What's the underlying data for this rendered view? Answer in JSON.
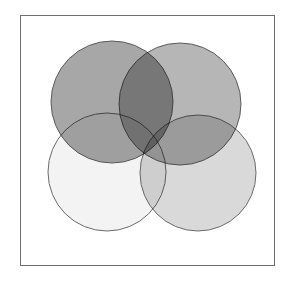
{
  "figure": {
    "kind": "venn-diagram",
    "width": 288,
    "height": 281,
    "background_color": "#ffffff",
    "title": ""
  },
  "frame": {
    "name": "plot-frame",
    "x": 20,
    "y": 15,
    "width": 255,
    "height": 251,
    "border_color": "#6e6e72",
    "border_width": 1,
    "fill_color": "#ffffff"
  },
  "chart_data": {
    "type": "venn",
    "title": "",
    "xlabel": "",
    "ylabel": "",
    "grid": false,
    "legend": "none",
    "axis_visible": false,
    "set_count": 4,
    "layout": "2x2 overlapping circles",
    "circles": [
      {
        "id": "circle-top-left",
        "label": "",
        "cx": 112,
        "cy": 102,
        "r": 61,
        "fill": "#8e8e8e",
        "opacity": 0.78,
        "stroke": "#5a5a5e",
        "stroke_width": 1,
        "tone": "dark-gray"
      },
      {
        "id": "circle-top-right",
        "label": "",
        "cx": 180,
        "cy": 104,
        "r": 61,
        "fill": "#9a9a9a",
        "opacity": 0.72,
        "stroke": "#5a5a5e",
        "stroke_width": 1,
        "tone": "medium-dark-gray"
      },
      {
        "id": "circle-bottom-left",
        "label": "",
        "cx": 107,
        "cy": 172,
        "r": 59,
        "fill": "#f1f1f1",
        "opacity": 0.88,
        "stroke": "#6a6a6e",
        "stroke_width": 1,
        "tone": "near-white"
      },
      {
        "id": "circle-bottom-right",
        "label": "",
        "cx": 198,
        "cy": 173,
        "r": 58,
        "fill": "#cfcfcf",
        "opacity": 0.8,
        "stroke": "#6a6a6e",
        "stroke_width": 1,
        "tone": "light-gray"
      }
    ],
    "intersections": [
      {
        "between": [
          "circle-top-left",
          "circle-top-right"
        ],
        "tone": "darkest-gray",
        "approx_fill": "#7b7b7b"
      },
      {
        "between": [
          "circle-top-left",
          "circle-bottom-left"
        ],
        "tone": "medium-gray",
        "approx_fill": "#b6b6b6"
      },
      {
        "between": [
          "circle-top-right",
          "circle-bottom-right"
        ],
        "tone": "medium-gray",
        "approx_fill": "#a8a8a8"
      },
      {
        "between": [
          "circle-bottom-left",
          "circle-bottom-right"
        ],
        "tone": "light-gray",
        "approx_fill": "#d8d8d8"
      },
      {
        "between": [
          "circle-top-left",
          "circle-top-right",
          "circle-bottom-left",
          "circle-bottom-right"
        ],
        "tone": "center-blend",
        "approx_fill": "#b0b0b0"
      }
    ],
    "colors": {
      "frame_stroke": "#6e6e72",
      "background": "#ffffff",
      "circle_stroke": "#5a5a5e"
    }
  }
}
